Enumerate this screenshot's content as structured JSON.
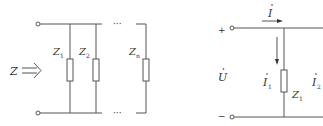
{
  "left_circuit": {
    "impedance_label": "Z",
    "arrow_symbol": "⟹",
    "ellipsis_top": "···",
    "ellipsis_bottom": "···",
    "branches": [
      {
        "label": "Z",
        "sub": "1"
      },
      {
        "label": "Z",
        "sub": "2"
      },
      {
        "label": "Z",
        "sub": "n"
      }
    ]
  },
  "right_circuit": {
    "plus": "+",
    "minus": "−",
    "voltage_label": "U",
    "current_total": {
      "label": "I",
      "sub": ""
    },
    "current_branch": {
      "label": "I",
      "sub": "1"
    },
    "current_through": {
      "label": "I",
      "sub": "2"
    },
    "impedance": {
      "label": "Z",
      "sub": "1"
    }
  },
  "colors": {
    "wire": "#555555",
    "text": "#333333"
  }
}
